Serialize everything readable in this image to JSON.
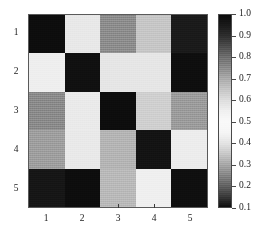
{
  "chart_data": {
    "type": "heatmap",
    "title": "",
    "xlabel": "",
    "ylabel": "",
    "x_tick_labels": [
      "1",
      "2",
      "3",
      "4",
      "5"
    ],
    "y_tick_labels": [
      "1",
      "2",
      "3",
      "4",
      "5"
    ],
    "row_labels": [
      "1",
      "2",
      "3",
      "4",
      "5"
    ],
    "column_labels": [
      "1",
      "2",
      "3",
      "4",
      "5"
    ],
    "grid": [
      [
        1.0,
        0.55,
        0.75,
        0.62,
        0.95
      ],
      [
        0.5,
        1.0,
        0.5,
        0.5,
        1.0
      ],
      [
        0.78,
        0.5,
        1.0,
        0.6,
        0.72
      ],
      [
        0.75,
        0.5,
        0.7,
        1.0,
        0.5
      ],
      [
        0.95,
        1.0,
        0.65,
        0.47,
        1.0
      ]
    ],
    "cell_colors": [
      [
        "#0d0d0d",
        "#e8e8e8",
        "#8c8c8c",
        "#c6c6c6",
        "#1a1a1a"
      ],
      [
        "#eeeeee",
        "#101010",
        "#e6e6e6",
        "#e6e6e6",
        "#0e0e0e"
      ],
      [
        "#8a8a8a",
        "#eaeaea",
        "#0d0d0d",
        "#cfcfcf",
        "#9b9b9b"
      ],
      [
        "#9e9e9e",
        "#e9e9e9",
        "#b4b4b4",
        "#131313",
        "#ececec"
      ],
      [
        "#161616",
        "#0d0d0d",
        "#b9b9b9",
        "#efefef",
        "#0f0f0f"
      ]
    ],
    "colorbar": {
      "orientation": "vertical",
      "vmin": 0.1,
      "vmax": 1.0,
      "tick_labels": [
        "1.0",
        "0.9",
        "0.8",
        "0.7",
        "0.6",
        "0.5",
        "0.4",
        "0.3",
        "0.2",
        "0.1"
      ],
      "tick_values": [
        1.0,
        0.9,
        0.8,
        0.7,
        0.6,
        0.5,
        0.4,
        0.3,
        0.2,
        0.1
      ],
      "description": "grayscale ramp: dark at 1.0, white near 0.45-0.55, dark at 0.1"
    },
    "grid_lines": false,
    "legend_position": "right"
  },
  "colors": {
    "background": "#ffffff",
    "axis_line": "#5a5a5a",
    "tick_mark": "#3a3a3a",
    "text": "#1a1a1a"
  }
}
